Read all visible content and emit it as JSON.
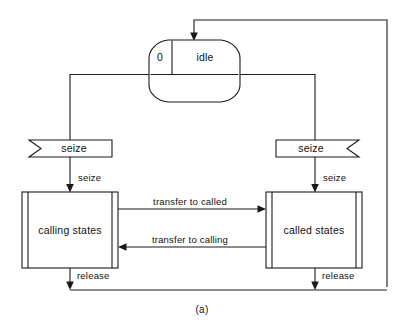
{
  "figure": {
    "caption": "(a)",
    "type": "state-transition-diagram"
  },
  "nodes": {
    "idle_resource": {
      "shape": "barrel",
      "count_label": "0",
      "state_label": "idle"
    },
    "calling_states": {
      "shape": "predefined-process",
      "label": "calling states"
    },
    "called_states": {
      "shape": "predefined-process",
      "label": "called states"
    },
    "seize_left": {
      "shape": "banner-left-notch",
      "label": "seize"
    },
    "seize_right": {
      "shape": "banner-right-notch",
      "label": "seize"
    }
  },
  "edges": {
    "seize_to_calling": "seize",
    "seize_to_called": "seize",
    "transfer_to_called": "transfer to called",
    "transfer_to_calling": "transfer to calling",
    "release_left": "release",
    "release_right": "release"
  },
  "colors": {
    "stroke": "#1a1a1a",
    "fill": "#ffffff",
    "text": "#111111",
    "background": "#ffffff"
  }
}
